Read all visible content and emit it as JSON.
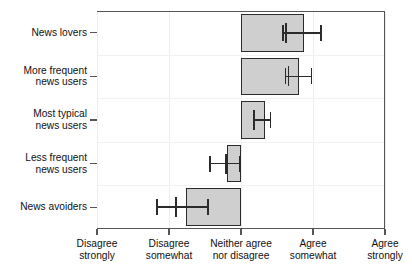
{
  "chart_data": {
    "type": "bar",
    "orientation": "horizontal",
    "title": "",
    "subtitle": "",
    "xlabel": "",
    "ylabel": "",
    "grid": true,
    "legend": null,
    "xlim": [
      1,
      5
    ],
    "x_tick_values": [
      1,
      2,
      3,
      4,
      5
    ],
    "x_tick_labels": [
      "Disagree\nstrongly",
      "Disagree\nsomewhat",
      "Neither agree\nnor disagree",
      "Agree\nsomewhat",
      "Agree\nstrongly"
    ],
    "categories": [
      "News lovers",
      "More frequent\nnews users",
      "Most typical\nnews users",
      "Less frequent\nnews users",
      "News avoiders"
    ],
    "baseline": 3.0,
    "values": [
      3.87,
      3.8,
      3.33,
      2.81,
      2.23
    ],
    "error_low": [
      3.58,
      3.62,
      3.18,
      2.57,
      1.83
    ],
    "error_high": [
      4.11,
      3.98,
      3.41,
      2.98,
      2.54
    ],
    "point_estimates": [
      3.62,
      3.66,
      3.18,
      2.79,
      2.1
    ],
    "bar_color": "#cfcfcf",
    "bar_edge_color": "#2b2b2b",
    "error_color": "#2b2b2b",
    "axis_color": "#555555",
    "series": [
      {
        "name": "Agreement",
        "values": [
          3.87,
          3.8,
          3.33,
          2.81,
          2.23
        ]
      }
    ]
  }
}
